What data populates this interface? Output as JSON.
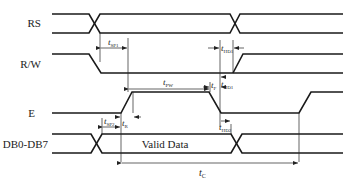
{
  "diagram": {
    "type": "timing-diagram",
    "signals": [
      {
        "name": "RS",
        "label": "RS"
      },
      {
        "name": "R/W",
        "label": "R/W"
      },
      {
        "name": "E",
        "label": "E"
      },
      {
        "name": "DB0-DB7",
        "label": "DB0-DB7"
      }
    ],
    "data_label": "Valid Data",
    "timing_params": {
      "tsp1": {
        "t": "t",
        "sub": "SP1"
      },
      "thd1_rs": {
        "t": "t",
        "sub": "HD1"
      },
      "thd1_rw": {
        "t": "t",
        "sub": "HD1"
      },
      "tpw": {
        "t": "t",
        "sub": "PW"
      },
      "tf": {
        "t": "t",
        "sub": "F"
      },
      "tsp2": {
        "t": "t",
        "sub": "SP2"
      },
      "tr": {
        "t": "t",
        "sub": "R"
      },
      "thd2": {
        "t": "t",
        "sub": "HD2"
      },
      "tc": {
        "t": "t",
        "sub": "C"
      }
    },
    "colors": {
      "line": "#1a1a1a",
      "background": "#ffffff"
    }
  }
}
